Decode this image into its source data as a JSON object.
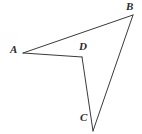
{
  "figure": {
    "background_color": "#ffffff",
    "stroke_color": "#3a3a3a",
    "stroke_width": 1,
    "label_color": "#2b2b2b",
    "width": 142,
    "height": 134,
    "points": {
      "A": {
        "x": 23,
        "y": 53
      },
      "B": {
        "x": 133,
        "y": 15
      },
      "C": {
        "x": 93,
        "y": 131
      },
      "D": {
        "x": 82,
        "y": 57
      }
    },
    "segments": [
      {
        "name": "segment-AB",
        "from": "A",
        "to": "B"
      },
      {
        "name": "segment-AD",
        "from": "A",
        "to": "D"
      },
      {
        "name": "segment-DC",
        "from": "D",
        "to": "C"
      },
      {
        "name": "segment-CB",
        "from": "C",
        "to": "B"
      }
    ],
    "labels": [
      {
        "name": "vertex-label-A",
        "text": "A",
        "x": 10,
        "y": 44
      },
      {
        "name": "vertex-label-B",
        "text": "B",
        "x": 126,
        "y": 1
      },
      {
        "name": "vertex-label-C",
        "text": "C",
        "x": 80,
        "y": 112
      },
      {
        "name": "vertex-label-D",
        "text": "D",
        "x": 79,
        "y": 41
      }
    ]
  }
}
